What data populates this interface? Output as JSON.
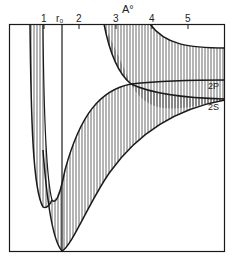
{
  "axis": {
    "unit_label": "A°",
    "ticks": [
      {
        "label": "1",
        "x": 44
      },
      {
        "label": "r₀",
        "x": 61
      },
      {
        "label": "2",
        "x": 79
      },
      {
        "label": "3",
        "x": 116
      },
      {
        "label": "4",
        "x": 152
      },
      {
        "label": "5",
        "x": 188
      }
    ]
  },
  "curves": {
    "label_2p": "2P",
    "label_2s": "2S"
  },
  "colors": {
    "line": "#1a1a1a",
    "hatch": "#333333",
    "background": "#ffffff"
  }
}
